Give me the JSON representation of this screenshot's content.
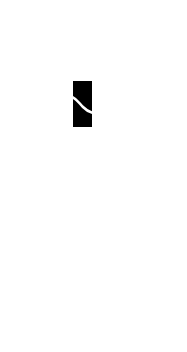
{
  "screen": {
    "type": "splash",
    "background_color": "#ffffff"
  },
  "logo": {
    "icon": "app-logo-icon",
    "shape": "black rectangle with diagonal white slash",
    "fill_color": "#000000",
    "slash_color": "#ffffff"
  }
}
